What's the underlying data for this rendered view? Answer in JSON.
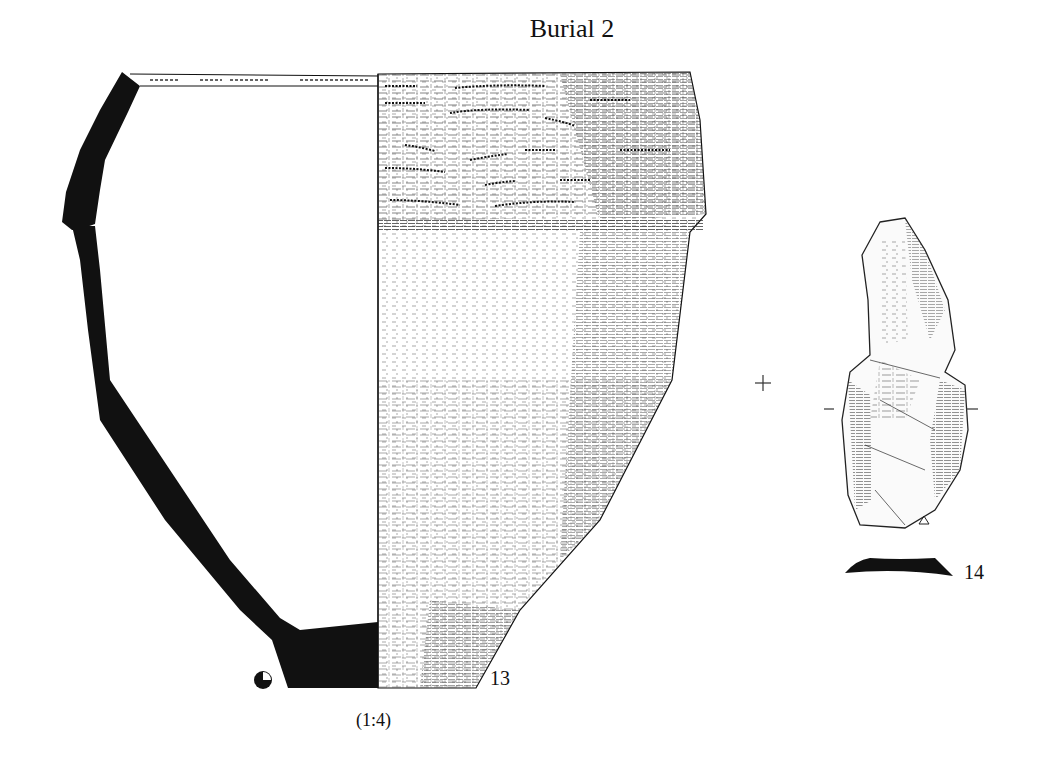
{
  "title": "Burial 2",
  "objects": [
    {
      "id": "13",
      "label": "13",
      "type": "ceramic-vessel-profile",
      "description": "Beaker profile: left half section (solid black wall), right half exterior view with cord-impressed decoration and surface texture"
    },
    {
      "id": "14",
      "label": "14",
      "type": "flint-tool",
      "description": "Retouched flint blade tool drawing with cross-section below"
    }
  ],
  "scale": "(1:4)",
  "symbols": {
    "orientation_cross": "+",
    "section_marks": [
      "–",
      "–"
    ],
    "bulb_marker": "△",
    "pie_icon": "rotational-coverage-icon"
  },
  "colors": {
    "ink": "#111111",
    "background": "#ffffff"
  }
}
